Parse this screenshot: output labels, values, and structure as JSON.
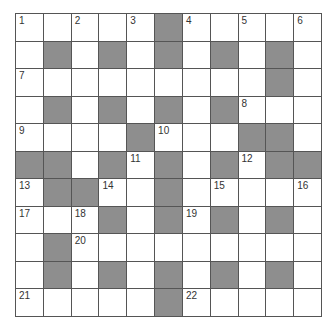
{
  "puzzle": {
    "rows": 11,
    "cols": 11,
    "colors": {
      "block": "#8e8e8e",
      "cell": "#ffffff",
      "line": "#555555"
    },
    "layout": [
      "WWWWW#WWWWW",
      "W#W#W#W#W#W",
      "WWWWWWWWW#W",
      "W#W#W#W#WWW",
      "WWWW#WWW##W",
      "##W#W#W#W##",
      "W##WW#WWWWW",
      "WWW#W#W#W#W",
      "W#WWWWWWWWW",
      "W#W#W#W#W#W",
      "WWWWW#WWWWW"
    ],
    "numbers": [
      {
        "r": 0,
        "c": 0,
        "n": "1"
      },
      {
        "r": 0,
        "c": 2,
        "n": "2"
      },
      {
        "r": 0,
        "c": 4,
        "n": "3"
      },
      {
        "r": 0,
        "c": 6,
        "n": "4"
      },
      {
        "r": 0,
        "c": 8,
        "n": "5"
      },
      {
        "r": 0,
        "c": 10,
        "n": "6"
      },
      {
        "r": 2,
        "c": 0,
        "n": "7"
      },
      {
        "r": 3,
        "c": 8,
        "n": "8"
      },
      {
        "r": 4,
        "c": 0,
        "n": "9"
      },
      {
        "r": 4,
        "c": 5,
        "n": "10"
      },
      {
        "r": 5,
        "c": 4,
        "n": "11"
      },
      {
        "r": 5,
        "c": 8,
        "n": "12"
      },
      {
        "r": 6,
        "c": 0,
        "n": "13"
      },
      {
        "r": 6,
        "c": 3,
        "n": "14"
      },
      {
        "r": 6,
        "c": 7,
        "n": "15"
      },
      {
        "r": 6,
        "c": 10,
        "n": "16"
      },
      {
        "r": 7,
        "c": 0,
        "n": "17"
      },
      {
        "r": 7,
        "c": 2,
        "n": "18"
      },
      {
        "r": 7,
        "c": 6,
        "n": "19"
      },
      {
        "r": 8,
        "c": 2,
        "n": "20"
      },
      {
        "r": 10,
        "c": 0,
        "n": "21"
      },
      {
        "r": 10,
        "c": 6,
        "n": "22"
      }
    ]
  }
}
